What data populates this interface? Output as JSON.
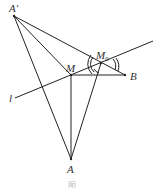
{
  "diagram": {
    "type": "geometry-reflection",
    "stroke_color": "#222222",
    "points": {
      "A_prime": {
        "label": "A'",
        "x": 14,
        "y": 16
      },
      "M": {
        "label": "M",
        "x": 71,
        "y": 75
      },
      "M0": {
        "label": "M",
        "sub": "0",
        "x": 101,
        "y": 63
      },
      "B": {
        "label": "B",
        "x": 125,
        "y": 75
      },
      "A": {
        "label": "A",
        "x": 71,
        "y": 159
      }
    },
    "line_l": {
      "label": "l",
      "x1": 15,
      "y1": 98,
      "x2": 153,
      "y2": 41
    },
    "segments": [
      [
        "A_prime",
        "B"
      ],
      [
        "A_prime",
        "M"
      ],
      [
        "A_prime",
        "A"
      ],
      [
        "M",
        "B"
      ],
      [
        "M",
        "A"
      ],
      [
        "M0",
        "A"
      ]
    ],
    "angle_marks": "double arcs at M0 marking equal angles",
    "caption": "图"
  }
}
